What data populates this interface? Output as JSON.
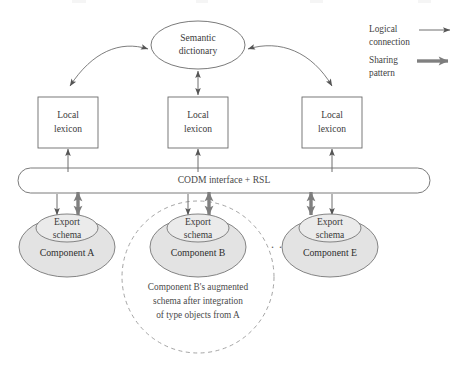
{
  "diagram": {
    "title_semantic_dictionary": "Semantic\ndictionary",
    "semantic_dictionary": {
      "line1": "Semantic",
      "line2": "dictionary"
    },
    "lexicons": [
      {
        "id": "local-lexicon-a",
        "line1": "Local",
        "line2": "lexicon"
      },
      {
        "id": "local-lexicon-b",
        "line1": "Local",
        "line2": "lexicon"
      },
      {
        "id": "local-lexicon-e",
        "line1": "Local",
        "line2": "lexicon"
      }
    ],
    "middleware_bar": {
      "label": "CODM interface + RSL"
    },
    "components": [
      {
        "id": "component-a",
        "export_line1": "Export",
        "export_line2": "schema",
        "name": "Component A"
      },
      {
        "id": "component-b",
        "export_line1": "Export",
        "export_line2": "schema",
        "name": "Component B"
      },
      {
        "id": "component-e",
        "export_line1": "Export",
        "export_line2": "schema",
        "name": "Component E"
      }
    ],
    "ellipsis": ". . .",
    "augmented_caption": {
      "line1": "Component B's augmented",
      "line2": "schema after integration",
      "line3": "of type objects from A"
    },
    "legend": {
      "items": [
        {
          "id": "legend-logical-connection",
          "line1": "Logical",
          "line2": "connection",
          "arrow": "thin-arrow-icon"
        },
        {
          "id": "legend-sharing-pattern",
          "line1": "Sharing",
          "line2": "pattern",
          "arrow": "thick-arrow-icon"
        }
      ]
    },
    "colors": {
      "component_fill": "#e3e3e3",
      "export_fill": "#ebebeb",
      "outline": "#6b6b6b",
      "thin_arrow": "#6f6f6f",
      "thick_arrow": "#808080",
      "dashed_circle": "#9a9a9a",
      "text": "#3a3a3a",
      "background": "#ffffff"
    }
  }
}
